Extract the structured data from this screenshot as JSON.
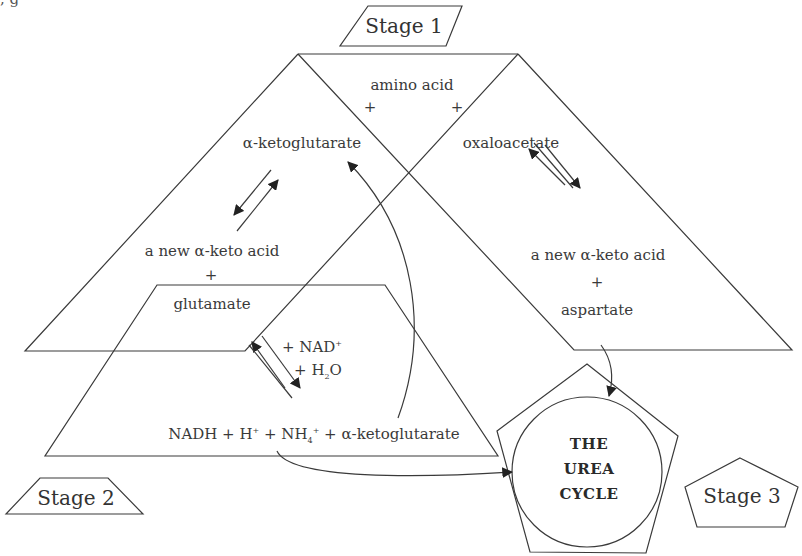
{
  "diagram": {
    "title_fragment": ", g",
    "stages": {
      "stage1": "Stage 1",
      "stage2": "Stage 2",
      "stage3": "Stage 3"
    },
    "stage1_left": {
      "amino_acid": "amino acid",
      "plus_left": "+",
      "alpha_ketoglutarate": "α-ketoglutarate",
      "new_keto_acid": "a new α-keto acid",
      "plus_bottom": "+",
      "glutamate": "glutamate"
    },
    "stage1_right": {
      "plus_right": "+",
      "oxaloacetate": "oxaloacetate",
      "new_keto_acid": "a new α-keto acid",
      "plus": "+",
      "aspartate": "aspartate"
    },
    "stage2": {
      "nad_label_prefix": "+ NAD",
      "nad_sup": "+",
      "h2o_prefix": "+ H",
      "h2o_sub": "2",
      "h2o_suffix": "O",
      "products_nadh": "NADH + H",
      "products_h_sup": "+",
      "products_nh": " + NH",
      "products_nh_sub": "4",
      "products_nh_sup": "+",
      "products_akg": " + α-ketoglutarate"
    },
    "urea_cycle": {
      "line1": "THE",
      "line2": "UREA",
      "line3": "CYCLE"
    },
    "colors": {
      "stroke": "#3a3a3a",
      "text": "#3a3a3a",
      "background": "#ffffff"
    }
  }
}
